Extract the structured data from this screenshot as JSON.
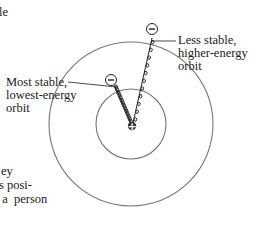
{
  "diagram": {
    "labels": {
      "inner_orbit": [
        "Most stable,",
        "lowest-energy",
        "orbit"
      ],
      "outer_orbit": [
        "Less stable,",
        "higher-energy",
        "orbit"
      ]
    },
    "symbols": {
      "nucleus": "+",
      "electron": "−"
    },
    "colors": {
      "orbit_stroke": "#777777",
      "ink": "#1a1a1a",
      "background": "#ffffff"
    }
  },
  "body_text_fragments": {
    "top": "le",
    "lines": [
      "ey",
      "s posi-",
      " a  person"
    ]
  }
}
